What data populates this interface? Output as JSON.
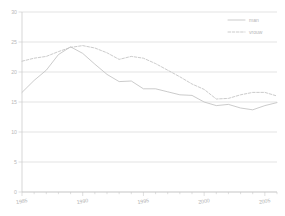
{
  "chart_data": {
    "type": "line",
    "title": "",
    "subtitle": "",
    "xlabel": "",
    "ylabel": "",
    "xlim": [
      1985,
      2006
    ],
    "ylim": [
      0,
      30
    ],
    "grid": "horizontal",
    "legend_position": "top-right",
    "x": [
      1985,
      1986,
      1987,
      1988,
      1989,
      1990,
      1991,
      1992,
      1993,
      1994,
      1995,
      1996,
      1997,
      1998,
      1999,
      2000,
      2001,
      2002,
      2003,
      2004,
      2005,
      2006
    ],
    "xticks": [
      1985,
      1990,
      1995,
      2000,
      2005
    ],
    "xtick_labels": [
      "1985",
      "1990",
      "1995",
      "2000",
      "2005"
    ],
    "yticks": [
      0,
      5,
      10,
      15,
      20,
      25,
      30
    ],
    "ytick_labels": [
      "0",
      "5",
      "10",
      "15",
      "20",
      "25",
      "30"
    ],
    "series": [
      {
        "name": "man",
        "style": "solid",
        "color": "#c2c2c2",
        "values": [
          16.6,
          18.6,
          20.3,
          22.9,
          24.2,
          23.1,
          21.3,
          19.6,
          18.4,
          18.5,
          17.2,
          17.2,
          16.7,
          16.2,
          16.1,
          15.0,
          14.4,
          14.6,
          14.0,
          13.7,
          14.4,
          14.9
        ]
      },
      {
        "name": "vrouw",
        "style": "dashed",
        "color": "#c2c2c2",
        "values": [
          21.8,
          22.3,
          22.6,
          23.4,
          24.1,
          24.4,
          24.0,
          23.2,
          22.1,
          22.6,
          22.3,
          21.4,
          20.3,
          19.2,
          18.0,
          17.1,
          15.5,
          15.6,
          16.2,
          16.6,
          16.6,
          16.0
        ]
      }
    ],
    "legend": [
      {
        "label": "man",
        "style": "solid"
      },
      {
        "label": "vrouw",
        "style": "dashed"
      }
    ]
  }
}
